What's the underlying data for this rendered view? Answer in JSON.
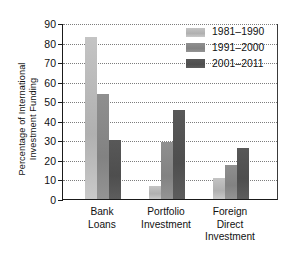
{
  "chart_data": {
    "type": "bar",
    "title": "",
    "xlabel": "",
    "ylabel": "Percentage of International\nInvestment Funding",
    "ylim": [
      0,
      90
    ],
    "yticks": [
      0,
      10,
      20,
      30,
      40,
      50,
      60,
      70,
      80,
      90
    ],
    "grid": true,
    "legend_position": "top-right",
    "categories": [
      "Bank\nLoans",
      "Portfolio\nInvestment",
      "Foreign\nDirect\nInvestment"
    ],
    "series": [
      {
        "name": "1981–1990",
        "color": "#b8b8b8",
        "values": [
          83,
          6.5,
          10.5
        ]
      },
      {
        "name": "1991–2000",
        "color": "#8a8a8a",
        "values": [
          53.5,
          29,
          17.5
        ]
      },
      {
        "name": "2001–2011",
        "color": "#545454",
        "values": [
          30,
          45.5,
          26
        ]
      }
    ]
  },
  "legend": {
    "items": [
      {
        "label": "1981–1990"
      },
      {
        "label": "1991–2000"
      },
      {
        "label": "2001–2011"
      }
    ]
  },
  "axis": {
    "y_tick_labels": [
      "90",
      "80",
      "70",
      "60",
      "50",
      "40",
      "30",
      "20",
      "10",
      "0"
    ],
    "x_tick_labels": [
      "Bank\nLoans",
      "Portfolio\nInvestment",
      "Foreign\nDirect\nInvestment"
    ]
  }
}
